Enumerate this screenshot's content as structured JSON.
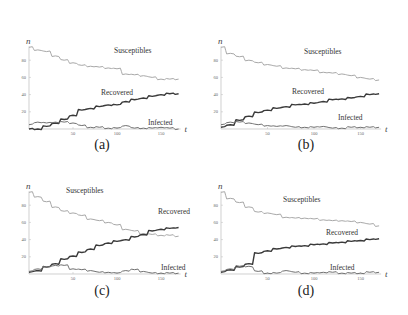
{
  "figure": {
    "panels": [
      {
        "id": "a",
        "caption": "(a)"
      },
      {
        "id": "b",
        "caption": "(b)"
      },
      {
        "id": "c",
        "caption": "(c)"
      },
      {
        "id": "d",
        "caption": "(d)"
      }
    ]
  },
  "colors": {
    "susceptibles": "#a8a8a8",
    "recovered": "#3a3a3a",
    "infected": "#707070",
    "axis": "#bbbbbb"
  },
  "chart_data": [
    {
      "type": "line",
      "panel": "(a)",
      "xlabel": "t",
      "ylabel": "n",
      "x_ticks": [
        50,
        100,
        150
      ],
      "y_ticks": [
        20,
        40,
        60,
        80
      ],
      "xlim": [
        0,
        170
      ],
      "ylim": [
        0,
        95
      ],
      "series": [
        {
          "name": "Susceptibles",
          "x": [
            0,
            10,
            20,
            30,
            40,
            50,
            60,
            70,
            80,
            90,
            100,
            110,
            120,
            130,
            140,
            150,
            160,
            170
          ],
          "values": [
            95,
            92,
            90,
            85,
            80,
            77,
            74,
            73,
            72,
            71,
            70,
            64,
            63,
            62,
            60,
            58,
            58,
            58
          ]
        },
        {
          "name": "Recovered",
          "x": [
            0,
            10,
            20,
            30,
            40,
            50,
            60,
            70,
            80,
            90,
            100,
            110,
            120,
            130,
            140,
            150,
            160,
            170
          ],
          "values": [
            0,
            0,
            3,
            7,
            11,
            16,
            22,
            24,
            26,
            28,
            28,
            32,
            34,
            36,
            38,
            40,
            41,
            41
          ]
        },
        {
          "name": "Infected",
          "x": [
            0,
            10,
            20,
            30,
            40,
            50,
            60,
            70,
            80,
            90,
            100,
            110,
            120,
            130,
            140,
            150,
            160,
            170
          ],
          "values": [
            5,
            8,
            7,
            8,
            8,
            7,
            4,
            2,
            2,
            1,
            1,
            4,
            1,
            1,
            1,
            2,
            1,
            0
          ]
        }
      ],
      "annotations": [
        "Susceptibles",
        "Recovered",
        "Infected"
      ]
    },
    {
      "type": "line",
      "panel": "(b)",
      "xlabel": "t",
      "ylabel": "n",
      "x_ticks": [
        50,
        100,
        150
      ],
      "y_ticks": [
        20,
        40,
        60,
        80
      ],
      "xlim": [
        0,
        170
      ],
      "ylim": [
        0,
        95
      ],
      "series": [
        {
          "name": "Susceptibles",
          "x": [
            0,
            10,
            20,
            30,
            40,
            50,
            60,
            70,
            80,
            90,
            100,
            110,
            120,
            130,
            140,
            150,
            160,
            170
          ],
          "values": [
            95,
            88,
            84,
            80,
            77,
            75,
            73,
            71,
            70,
            69,
            68,
            66,
            65,
            64,
            62,
            60,
            58,
            57
          ]
        },
        {
          "name": "Recovered",
          "x": [
            0,
            10,
            20,
            30,
            40,
            50,
            60,
            70,
            80,
            90,
            100,
            110,
            120,
            130,
            140,
            150,
            160,
            170
          ],
          "values": [
            2,
            5,
            10,
            15,
            19,
            22,
            24,
            26,
            28,
            29,
            30,
            32,
            34,
            35,
            36,
            38,
            40,
            41
          ]
        },
        {
          "name": "Infected",
          "x": [
            0,
            10,
            20,
            30,
            40,
            50,
            60,
            70,
            80,
            90,
            100,
            110,
            120,
            130,
            140,
            150,
            160,
            170
          ],
          "values": [
            5,
            8,
            8,
            7,
            5,
            4,
            3,
            4,
            2,
            2,
            2,
            3,
            1,
            1,
            2,
            2,
            2,
            2
          ]
        }
      ],
      "annotations": [
        "Susceptibles",
        "Recovered",
        "Infected"
      ]
    },
    {
      "type": "line",
      "panel": "(c)",
      "xlabel": "t",
      "ylabel": "n",
      "x_ticks": [
        50,
        100,
        150
      ],
      "y_ticks": [
        20,
        40,
        60,
        80
      ],
      "xlim": [
        0,
        170
      ],
      "ylim": [
        0,
        95
      ],
      "series": [
        {
          "name": "Susceptibles",
          "x": [
            0,
            10,
            20,
            30,
            40,
            50,
            60,
            70,
            80,
            90,
            100,
            110,
            120,
            130,
            140,
            150,
            160,
            170
          ],
          "values": [
            95,
            90,
            84,
            78,
            73,
            71,
            68,
            64,
            62,
            60,
            57,
            52,
            50,
            47,
            46,
            45,
            45,
            44
          ]
        },
        {
          "name": "Recovered",
          "x": [
            0,
            10,
            20,
            30,
            40,
            50,
            60,
            70,
            80,
            90,
            100,
            110,
            120,
            130,
            140,
            150,
            160,
            170
          ],
          "values": [
            2,
            4,
            8,
            12,
            17,
            21,
            25,
            29,
            33,
            36,
            38,
            40,
            43,
            46,
            50,
            52,
            53,
            54
          ]
        },
        {
          "name": "Infected",
          "x": [
            0,
            10,
            20,
            30,
            40,
            50,
            60,
            70,
            80,
            90,
            100,
            110,
            120,
            130,
            140,
            150,
            160,
            170
          ],
          "values": [
            3,
            6,
            8,
            10,
            10,
            6,
            5,
            4,
            2,
            2,
            1,
            4,
            5,
            3,
            1,
            1,
            1,
            1
          ]
        }
      ],
      "annotations": [
        "Susceptibles",
        "Recovered",
        "Infected"
      ]
    },
    {
      "type": "line",
      "panel": "(d)",
      "xlabel": "t",
      "ylabel": "n",
      "x_ticks": [
        50,
        100,
        150
      ],
      "y_ticks": [
        20,
        40,
        60,
        80
      ],
      "xlim": [
        0,
        170
      ],
      "ylim": [
        0,
        95
      ],
      "series": [
        {
          "name": "Susceptibles",
          "x": [
            0,
            10,
            20,
            30,
            40,
            50,
            60,
            70,
            80,
            90,
            100,
            110,
            120,
            130,
            140,
            150,
            160,
            170
          ],
          "values": [
            95,
            88,
            83,
            78,
            72,
            71,
            69,
            66,
            65,
            65,
            64,
            63,
            62,
            62,
            61,
            60,
            58,
            56
          ]
        },
        {
          "name": "Recovered",
          "x": [
            0,
            10,
            20,
            30,
            40,
            50,
            60,
            70,
            80,
            90,
            100,
            110,
            120,
            130,
            140,
            150,
            160,
            170
          ],
          "values": [
            2,
            5,
            8,
            12,
            24,
            27,
            29,
            31,
            32,
            33,
            34,
            35,
            36,
            37,
            38,
            39,
            40,
            41
          ]
        },
        {
          "name": "Infected",
          "x": [
            0,
            10,
            20,
            30,
            40,
            50,
            60,
            70,
            80,
            90,
            100,
            110,
            120,
            130,
            140,
            150,
            160,
            170
          ],
          "values": [
            3,
            6,
            9,
            9,
            3,
            1,
            1,
            4,
            2,
            1,
            1,
            2,
            2,
            1,
            1,
            1,
            2,
            2
          ]
        }
      ],
      "annotations": [
        "Susceptibles",
        "Recovered",
        "Infected"
      ]
    }
  ]
}
